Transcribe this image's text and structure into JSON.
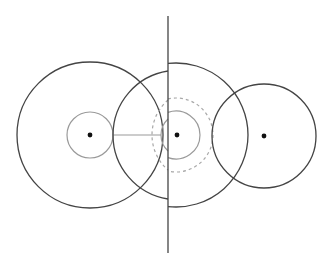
{
  "diagram": {
    "type": "geometric-circles",
    "width": 331,
    "height": 268,
    "colors": {
      "background": "#ffffff",
      "dark_stroke": "#444444",
      "gray_stroke": "#9a9a9a",
      "dashed_stroke": "#a8a8a8",
      "dot": "#111111"
    },
    "vertical_line": {
      "x": 168,
      "y1": 16,
      "y2": 253
    },
    "horizontal_segment": {
      "x1": 113,
      "x2": 161,
      "y": 135
    },
    "left_group": {
      "center": [
        90,
        135
      ],
      "outer_circle_r": 73,
      "inner_circle_r": 23
    },
    "middle_group": {
      "center": [
        176,
        135
      ],
      "right_half_outer_r": 72,
      "left_arc_outer": {
        "top": [
          168,
          71
        ],
        "leftmost": [
          113,
          135
        ],
        "bottom": [
          168,
          199
        ]
      },
      "right_half_inner_r": 24,
      "left_arc_inner": {
        "top": [
          168,
          119
        ],
        "leftmost": [
          161,
          135
        ],
        "bottom": [
          168,
          151
        ]
      },
      "dashed_right_r": 37,
      "dashed_left_arc": {
        "top": [
          168,
          100
        ],
        "leftmost": [
          152,
          135
        ],
        "bottom": [
          168,
          170
        ]
      }
    },
    "right_group": {
      "center": [
        264,
        136
      ],
      "circle_r": 52
    },
    "dots": [
      {
        "name": "left-center",
        "cx": 90,
        "cy": 135
      },
      {
        "name": "middle-center",
        "cx": 177,
        "cy": 135
      },
      {
        "name": "right-center",
        "cx": 264,
        "cy": 136
      }
    ]
  }
}
